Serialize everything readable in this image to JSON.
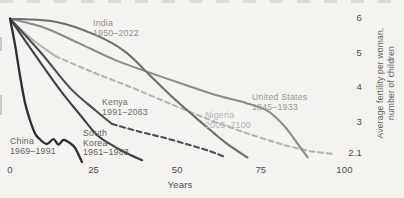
{
  "chart_data": {
    "type": "line",
    "title": "",
    "xlabel": "Years",
    "ylabel_lines": [
      "Average fertility per woman,",
      "number of children"
    ],
    "x_ticks": [
      "0",
      "25",
      "50",
      "75",
      "100"
    ],
    "y_ticks": [
      "6",
      "5",
      "4",
      "3",
      "2.1"
    ],
    "x_range": [
      0,
      100
    ],
    "y_range": [
      1.8,
      6
    ],
    "grid": false,
    "legend": "inline-labels",
    "series": [
      {
        "id": "nigeria",
        "name": "Nigeria",
        "period": "2005–2100",
        "label_lines": [
          "Nigeria",
          "2005–2100"
        ],
        "line_color": "#b4b3b0",
        "label_color": "#b3b2af",
        "segments": [
          {
            "style": "solid",
            "points": [
              [
                0,
                5.95
              ],
              [
                6.5,
                5.36
              ],
              [
                13.5,
                4.87
              ]
            ]
          },
          {
            "style": "dashed",
            "points": [
              [
                13.5,
                4.87
              ],
              [
                24,
                4.43
              ],
              [
                36,
                3.97
              ],
              [
                48,
                3.48
              ],
              [
                60,
                3.01
              ],
              [
                71.5,
                2.61
              ],
              [
                82,
                2.29
              ],
              [
                89.5,
                2.12
              ],
              [
                96.5,
                2.03
              ]
            ]
          }
        ]
      },
      {
        "id": "united-states",
        "name": "United States",
        "period": "1845–1933",
        "label_lines": [
          "United States",
          "1845–1933"
        ],
        "line_color": "#8d8c89",
        "label_color": "#98978f",
        "segments": [
          {
            "style": "solid",
            "points": [
              [
                0,
                5.95
              ],
              [
                10.5,
                5.68
              ],
              [
                21,
                5.22
              ],
              [
                31.5,
                4.75
              ],
              [
                42,
                4.38
              ],
              [
                52.5,
                4.03
              ],
              [
                61.5,
                3.74
              ],
              [
                70.5,
                3.51
              ],
              [
                77,
                3.28
              ],
              [
                82,
                2.84
              ],
              [
                86.5,
                2.26
              ],
              [
                89,
                1.93
              ]
            ]
          }
        ]
      },
      {
        "id": "india",
        "name": "India",
        "period": "1950–2022",
        "label_lines": [
          "India",
          "1950–2022"
        ],
        "line_color": "#6f6e6b",
        "label_color": "#8f8e8a",
        "segments": [
          {
            "style": "solid",
            "points": [
              [
                0,
                5.95
              ],
              [
                13.5,
                5.86
              ],
              [
                25.5,
                5.48
              ],
              [
                34.5,
                4.99
              ],
              [
                42,
                4.29
              ],
              [
                49.5,
                3.59
              ],
              [
                57,
                2.96
              ],
              [
                64.5,
                2.35
              ],
              [
                71,
                1.93
              ]
            ]
          }
        ]
      },
      {
        "id": "kenya",
        "name": "Kenya",
        "period": "1991–2063",
        "label_lines": [
          "Kenya",
          "1991–2063"
        ],
        "line_color": "#4f4e4c",
        "label_color": "#6e6d6a",
        "segments": [
          {
            "style": "solid",
            "points": [
              [
                0,
                5.95
              ],
              [
                9,
                4.99
              ],
              [
                18,
                3.94
              ],
              [
                25.5,
                3.3
              ],
              [
                30.5,
                2.9
              ]
            ]
          },
          {
            "style": "dashed",
            "points": [
              [
                30.5,
                2.9
              ],
              [
                39,
                2.67
              ],
              [
                46.5,
                2.49
              ],
              [
                54,
                2.28
              ],
              [
                60,
                2.1
              ],
              [
                64,
                1.95
              ]
            ]
          }
        ]
      },
      {
        "id": "south-korea",
        "name": "South Korea",
        "period": "1961–1983",
        "label_lines": [
          "South",
          "Korea",
          "1961–1983"
        ],
        "line_color": "#434240",
        "label_color": "#5f5e5b",
        "segments": [
          {
            "style": "solid",
            "points": [
              [
                0,
                5.95
              ],
              [
                7.5,
                4.9
              ],
              [
                15,
                3.88
              ],
              [
                21,
                3.16
              ],
              [
                26,
                2.58
              ],
              [
                31.5,
                2.23
              ],
              [
                36,
                2.0
              ],
              [
                39.5,
                1.85
              ]
            ]
          }
        ]
      },
      {
        "id": "china",
        "name": "China",
        "period": "1969–1991",
        "label_lines": [
          "China",
          "1969–1991"
        ],
        "line_color": "#2e2d2b",
        "label_color": "#646361",
        "segments": [
          {
            "style": "solid",
            "points": [
              [
                0,
                5.95
              ],
              [
                1.5,
                5.2
              ],
              [
                3,
                4.3
              ],
              [
                4.5,
                3.5
              ],
              [
                6,
                3.0
              ],
              [
                7.5,
                2.62
              ],
              [
                9,
                2.45
              ],
              [
                11,
                2.32
              ],
              [
                13,
                2.46
              ],
              [
                14.5,
                2.3
              ],
              [
                16,
                2.44
              ],
              [
                18,
                2.34
              ],
              [
                19.5,
                2.2
              ],
              [
                21.5,
                1.8
              ]
            ]
          }
        ]
      }
    ]
  }
}
